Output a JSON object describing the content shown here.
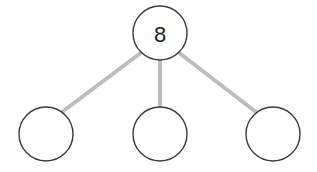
{
  "diagram": {
    "type": "number-bond",
    "colors": {
      "edge": "#bdbdbd",
      "node_stroke": "#3a3a3a",
      "node_fill": "#ffffff",
      "text": "#222222"
    },
    "nodes": [
      {
        "id": "whole",
        "label": "8",
        "cx": 160,
        "cy": 33,
        "r": 27
      },
      {
        "id": "part-left",
        "label": "",
        "cx": 46,
        "cy": 134,
        "r": 27
      },
      {
        "id": "part-middle",
        "label": "",
        "cx": 160,
        "cy": 134,
        "r": 27
      },
      {
        "id": "part-right",
        "label": "",
        "cx": 273,
        "cy": 134,
        "r": 27
      }
    ],
    "edges": [
      {
        "from": "whole",
        "to": "part-left"
      },
      {
        "from": "whole",
        "to": "part-middle"
      },
      {
        "from": "whole",
        "to": "part-right"
      }
    ]
  }
}
